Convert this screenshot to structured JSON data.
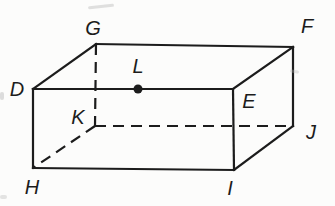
{
  "figure": {
    "type": "geometry-diagram",
    "shape": "rectangular-prism",
    "background": "#fcfcfb",
    "stroke": "#1c1c1c",
    "stroke_width": 2.2,
    "dash_pattern": "11,7",
    "label_font_size": 20,
    "label_color": "#1c1c1c",
    "vertices": {
      "D": {
        "x": 33,
        "y": 89,
        "label_x": 17,
        "label_y": 96
      },
      "E": {
        "x": 233,
        "y": 89,
        "label_x": 249,
        "label_y": 108
      },
      "F": {
        "x": 293,
        "y": 47,
        "label_x": 307,
        "label_y": 33
      },
      "G": {
        "x": 96,
        "y": 44,
        "label_x": 93,
        "label_y": 35
      },
      "H": {
        "x": 33,
        "y": 168,
        "label_x": 32,
        "label_y": 194
      },
      "I": {
        "x": 234,
        "y": 170,
        "label_x": 230,
        "label_y": 195
      },
      "J": {
        "x": 293,
        "y": 126,
        "label_x": 311,
        "label_y": 139
      },
      "K": {
        "x": 95,
        "y": 126,
        "label_x": 78,
        "label_y": 124
      }
    },
    "edges": [
      {
        "from": "G",
        "to": "K",
        "style": "dashed"
      },
      {
        "from": "K",
        "to": "J",
        "style": "dashed"
      },
      {
        "from": "K",
        "to": "H",
        "style": "dashed"
      },
      {
        "from": "D",
        "to": "E",
        "style": "solid"
      },
      {
        "from": "E",
        "to": "F",
        "style": "solid"
      },
      {
        "from": "F",
        "to": "G",
        "style": "solid"
      },
      {
        "from": "G",
        "to": "D",
        "style": "solid"
      },
      {
        "from": "D",
        "to": "H",
        "style": "solid"
      },
      {
        "from": "E",
        "to": "I",
        "style": "solid"
      },
      {
        "from": "F",
        "to": "J",
        "style": "solid"
      },
      {
        "from": "H",
        "to": "I",
        "style": "solid"
      },
      {
        "from": "I",
        "to": "J",
        "style": "solid"
      }
    ],
    "marked_point": {
      "label": "L",
      "x": 138,
      "y": 89,
      "radius": 4.5,
      "label_x": 138,
      "label_y": 73
    },
    "artifacts": [
      {
        "x": 88,
        "y": 5,
        "w": 26,
        "h": 3,
        "rotate": -6,
        "opacity": 0.4
      },
      {
        "x": 290,
        "y": 70,
        "w": 9,
        "h": 3,
        "rotate": 10,
        "opacity": 0.35
      },
      {
        "x": 0,
        "y": 92,
        "w": 4,
        "h": 8,
        "rotate": 0,
        "opacity": 0.45
      },
      {
        "x": 0,
        "y": 195,
        "w": 7,
        "h": 4,
        "rotate": 0,
        "opacity": 0.35
      }
    ]
  }
}
